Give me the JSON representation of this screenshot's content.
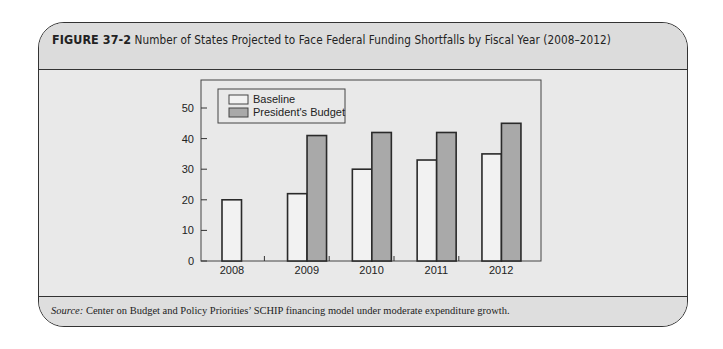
{
  "figure": {
    "number": "FIGURE 37-2",
    "title": "Number of States Projected to Face Federal Funding Shortfalls by Fiscal Year (2008–2012)"
  },
  "source": {
    "label": "Source:",
    "text": " Center on Budget and Policy Priorities’ SCHIP financing model under moderate expenditure growth."
  },
  "colors": {
    "baseline_fill": "#f2f2f2",
    "presidents_budget_fill": "#a9a9a9",
    "bar_edge": "#2a2a2a",
    "plot_bg": "#e9e9e9"
  },
  "chart_data": {
    "type": "bar",
    "title": "Number of States Projected to Face Federal Funding Shortfalls by Fiscal Year (2008–2012)",
    "xlabel": "",
    "ylabel": "",
    "categories": [
      "2008",
      "2009",
      "2010",
      "2011",
      "2012"
    ],
    "series": [
      {
        "name": "Baseline",
        "values": [
          20,
          22,
          30,
          33,
          35
        ]
      },
      {
        "name": "President's Budget",
        "values": [
          0,
          41,
          42,
          42,
          45
        ]
      }
    ],
    "ylim": [
      0,
      59
    ],
    "yticks": [
      0,
      10,
      20,
      30,
      40,
      50
    ],
    "grid": false,
    "legend_position": "upper left inside plot"
  }
}
